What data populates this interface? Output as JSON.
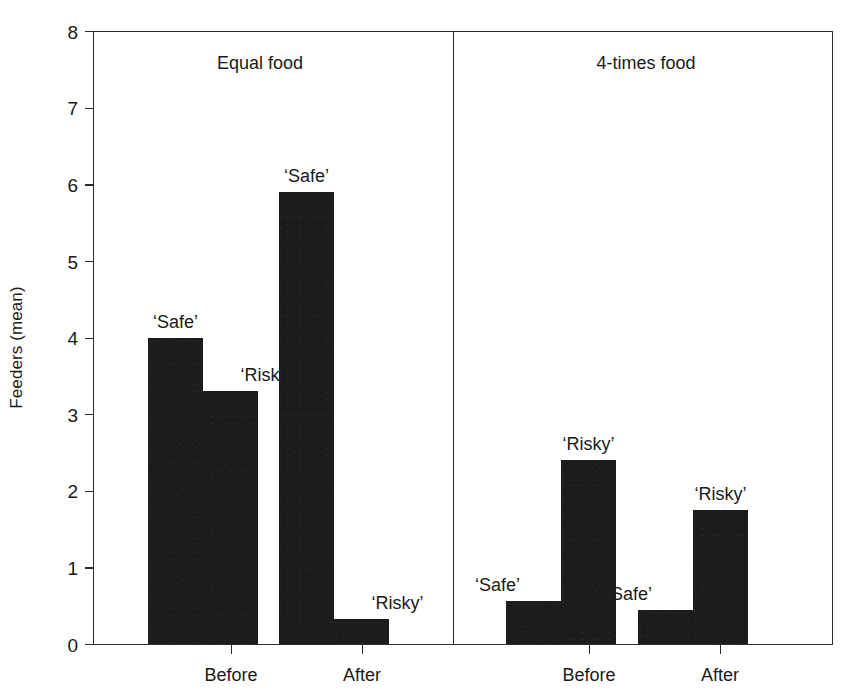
{
  "chart_data": {
    "type": "bar",
    "title": "",
    "xlabel": "",
    "ylabel": "Feeders (mean)",
    "ylim": [
      0,
      8
    ],
    "ytick_labels": [
      "0",
      "1",
      "2",
      "3",
      "4",
      "5",
      "6",
      "7",
      "8"
    ],
    "ytick_values": [
      0,
      1,
      2,
      3,
      4,
      5,
      6,
      7,
      8
    ],
    "grid": false,
    "legend": "none",
    "panels": [
      {
        "title": "Equal food",
        "categories": [
          "Before",
          "After"
        ],
        "groups": [
          {
            "category": "Before",
            "bars": [
              {
                "label": "‘Safe’",
                "value": 4.0
              },
              {
                "label": "‘Risky’",
                "value": 3.3
              }
            ]
          },
          {
            "category": "After",
            "bars": [
              {
                "label": "‘Safe’",
                "value": 5.9
              },
              {
                "label": "‘Risky’",
                "value": 0.33
              }
            ]
          }
        ]
      },
      {
        "title": "4-times food",
        "categories": [
          "Before",
          "After"
        ],
        "groups": [
          {
            "category": "Before",
            "bars": [
              {
                "label": "‘Safe’",
                "value": 0.56
              },
              {
                "label": "‘Risky’",
                "value": 2.4
              }
            ]
          },
          {
            "category": "After",
            "bars": [
              {
                "label": "‘Safe’",
                "value": 0.45
              },
              {
                "label": "‘Risky’",
                "value": 1.75
              }
            ]
          }
        ]
      }
    ],
    "series": [
      {
        "name": "‘Safe’",
        "values": [
          4.0,
          5.9,
          0.56,
          0.45
        ]
      },
      {
        "name": "‘Risky’",
        "values": [
          3.3,
          0.33,
          2.4,
          1.75
        ]
      }
    ],
    "x": [
      "Equal food / Before",
      "Equal food / After",
      "4-times food / Before",
      "4-times food / After"
    ],
    "bar_color": "#1c1c1c",
    "axis_color": "#2b2b2b",
    "background_color": "#ffffff"
  },
  "layout": {
    "plot_left": 93,
    "plot_top": 31,
    "plot_width": 740,
    "plot_height": 614,
    "divider_x": 360,
    "panel_title_x": [
      167,
      553
    ],
    "bar_geometry": [
      {
        "x": 55,
        "w": 55,
        "panel": 0,
        "group": 0,
        "series": 0
      },
      {
        "x": 110,
        "w": 55,
        "panel": 0,
        "group": 0,
        "series": 1
      },
      {
        "x": 186,
        "w": 55,
        "panel": 0,
        "group": 1,
        "series": 0
      },
      {
        "x": 241,
        "w": 55,
        "panel": 0,
        "group": 1,
        "series": 1
      },
      {
        "x": 413,
        "w": 55,
        "panel": 1,
        "group": 0,
        "series": 0
      },
      {
        "x": 468,
        "w": 55,
        "panel": 1,
        "group": 0,
        "series": 1
      },
      {
        "x": 545,
        "w": 55,
        "panel": 1,
        "group": 1,
        "series": 0
      },
      {
        "x": 600,
        "w": 55,
        "panel": 1,
        "group": 1,
        "series": 1
      }
    ],
    "xtick_x": [
      138,
      269,
      496,
      627
    ],
    "bar_label_offsets": [
      {
        "dx": 0,
        "dy": -26
      },
      {
        "dx": 36,
        "dy": -26
      },
      {
        "dx": 0,
        "dy": -26
      },
      {
        "dx": 36,
        "dy": -26
      },
      {
        "dx": -36,
        "dy": -26
      },
      {
        "dx": 0,
        "dy": -26
      },
      {
        "dx": -36,
        "dy": -26
      },
      {
        "dx": 0,
        "dy": -26
      }
    ]
  }
}
